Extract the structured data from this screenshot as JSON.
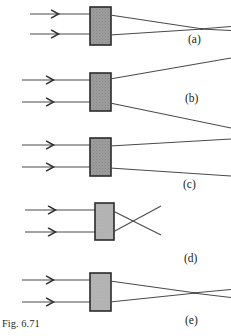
{
  "figure": {
    "caption": "Fig. 6.71",
    "background_color": "#ffffff",
    "ray_color": "#4a4a4a",
    "ray_color_dark": "#333333",
    "block_border_color": "#2b2b2b",
    "block_fill_dark": "#9e9e9e",
    "block_fill_light": "#b8b8b8",
    "label_color": "#1a1a1a"
  },
  "panels": [
    {
      "id": "a",
      "label": "(a)",
      "label_x": 188,
      "label_y": 33,
      "description": "two parallel rays enter block and converge to a focus at right",
      "block": {
        "x": 90,
        "y": 7,
        "width": 21,
        "height": 38,
        "fill": "#9e9e9e"
      },
      "incoming_rays": [
        {
          "x1": 30,
          "y1": 14,
          "x2": 90,
          "y2": 14,
          "arrow_x": 57,
          "arrow_y": 14
        },
        {
          "x1": 30,
          "y1": 34,
          "x2": 90,
          "y2": 34,
          "arrow_x": 57,
          "arrow_y": 34
        }
      ],
      "outgoing_rays": [
        {
          "x1": 111,
          "y1": 15,
          "x2": 203,
          "y2": 29
        },
        {
          "x1": 111,
          "y1": 35,
          "x2": 203,
          "y2": 29
        },
        {
          "x1": 203,
          "y1": 29,
          "x2": 231,
          "y2": 27
        },
        {
          "x1": 203,
          "y1": 29,
          "x2": 231,
          "y2": 30
        }
      ]
    },
    {
      "id": "b",
      "label": "(b)",
      "label_x": 185,
      "label_y": 92,
      "description": "two parallel rays enter block and diverge strongly",
      "block": {
        "x": 90,
        "y": 73,
        "width": 21,
        "height": 38,
        "fill": "#9e9e9e"
      },
      "incoming_rays": [
        {
          "x1": 22,
          "y1": 80,
          "x2": 90,
          "y2": 80,
          "arrow_x": 52,
          "arrow_y": 80
        },
        {
          "x1": 22,
          "y1": 102,
          "x2": 90,
          "y2": 102,
          "arrow_x": 52,
          "arrow_y": 102
        }
      ],
      "outgoing_rays": [
        {
          "x1": 111,
          "y1": 79,
          "x2": 231,
          "y2": 58
        },
        {
          "x1": 111,
          "y1": 103,
          "x2": 231,
          "y2": 128
        }
      ]
    },
    {
      "id": "c",
      "label": "(c)",
      "label_x": 183,
      "label_y": 178,
      "description": "two parallel rays enter block and diverge slightly",
      "block": {
        "x": 90,
        "y": 138,
        "width": 21,
        "height": 38,
        "fill": "#9e9e9e"
      },
      "incoming_rays": [
        {
          "x1": 22,
          "y1": 145,
          "x2": 90,
          "y2": 145,
          "arrow_x": 52,
          "arrow_y": 145
        },
        {
          "x1": 22,
          "y1": 167,
          "x2": 90,
          "y2": 167,
          "arrow_x": 52,
          "arrow_y": 167
        }
      ],
      "outgoing_rays": [
        {
          "x1": 111,
          "y1": 146,
          "x2": 231,
          "y2": 139
        },
        {
          "x1": 111,
          "y1": 168,
          "x2": 231,
          "y2": 176
        }
      ]
    },
    {
      "id": "d",
      "label": "(d)",
      "label_x": 184,
      "label_y": 252,
      "description": "two parallel rays enter block, cross just after it, then diverge",
      "block": {
        "x": 95,
        "y": 203,
        "width": 19,
        "height": 37,
        "fill": "#a8a8a8"
      },
      "incoming_rays": [
        {
          "x1": 25,
          "y1": 210,
          "x2": 95,
          "y2": 210,
          "arrow_x": 54,
          "arrow_y": 210
        },
        {
          "x1": 25,
          "y1": 232,
          "x2": 95,
          "y2": 232,
          "arrow_x": 54,
          "arrow_y": 232
        }
      ],
      "outgoing_rays": [
        {
          "x1": 114,
          "y1": 211,
          "x2": 160,
          "y2": 234
        },
        {
          "x1": 114,
          "y1": 232,
          "x2": 160,
          "y2": 207
        }
      ]
    },
    {
      "id": "e",
      "label": "(e)",
      "label_x": 185,
      "label_y": 314,
      "description": "two parallel rays enter block, converge to focus, then diverge",
      "block": {
        "x": 90,
        "y": 273,
        "width": 21,
        "height": 38,
        "fill": "#b8b8b8"
      },
      "incoming_rays": [
        {
          "x1": 22,
          "y1": 280,
          "x2": 90,
          "y2": 280,
          "arrow_x": 52,
          "arrow_y": 280
        },
        {
          "x1": 22,
          "y1": 302,
          "x2": 90,
          "y2": 302,
          "arrow_x": 52,
          "arrow_y": 302
        }
      ],
      "outgoing_rays": [
        {
          "x1": 111,
          "y1": 281,
          "x2": 196,
          "y2": 293
        },
        {
          "x1": 111,
          "y1": 302,
          "x2": 196,
          "y2": 293
        },
        {
          "x1": 196,
          "y1": 293,
          "x2": 231,
          "y2": 290
        },
        {
          "x1": 196,
          "y1": 293,
          "x2": 231,
          "y2": 297
        }
      ]
    }
  ]
}
